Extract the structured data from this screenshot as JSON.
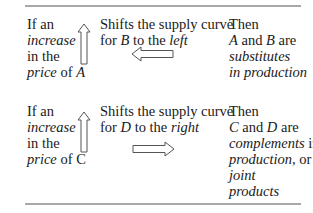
{
  "rows": [
    {
      "condition": {
        "line1": "If an",
        "line2_italic": "increase",
        "line3": "in the",
        "line4_italic": "price",
        "line4_rest": " of ",
        "line4_var": "A"
      },
      "condition_arrow": "up-arrow-icon",
      "effect": {
        "line1": "Shifts the supply curve",
        "line2_pre": "for ",
        "line2_var": "B",
        "line2_mid": " to the ",
        "line2_dir": "left"
      },
      "effect_arrow": "left-arrow-icon",
      "result": {
        "line1": "Then",
        "line2_var1": "A",
        "line2_mid": " and ",
        "line2_var2": "B",
        "line2_end": " are",
        "line3_italic": "substitutes",
        "line4_italic": "in production"
      }
    },
    {
      "condition": {
        "line1": "If an",
        "line2_italic": "increase",
        "line3": "in the",
        "line4_italic": "price",
        "line4_rest": " of C",
        "line4_var": ""
      },
      "condition_arrow": "up-arrow-icon",
      "effect": {
        "line1": "Shifts the supply curve",
        "line2_pre": "for ",
        "line2_var": "D",
        "line2_mid": " to the ",
        "line2_dir": "right"
      },
      "effect_arrow": "right-arrow-icon",
      "result": {
        "line1": "Then",
        "line2_var1": "C",
        "line2_mid": " and ",
        "line2_var2": "D",
        "line2_end": " are",
        "line3_italic": "complements",
        "line3_rest": " in",
        "line4_italic": "production,",
        "line4_rest": " or",
        "line5_italic": "joint",
        "line6_italic": "products"
      }
    }
  ],
  "colors": {
    "rule": "#a8a8a8",
    "text": "#1a1a1a",
    "arrow_stroke": "#555555"
  }
}
